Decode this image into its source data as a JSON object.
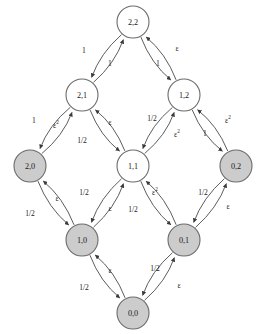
{
  "diagram": {
    "type": "directed-graph",
    "colors": {
      "node_fill_absorbing": "#cccccc",
      "node_fill_open": "#ffffff",
      "node_stroke": "#6b6b6b",
      "edge_stroke": "#4a4a4a",
      "background": "#ffffff",
      "text": "#1a1a1a"
    },
    "nodes": [
      {
        "id": "2,2",
        "label": "2,2",
        "x": 133,
        "y": 22,
        "r": 16,
        "filled": false
      },
      {
        "id": "2,1",
        "label": "2,1",
        "x": 82,
        "y": 95,
        "r": 16,
        "filled": false
      },
      {
        "id": "1,2",
        "label": "1,2",
        "x": 184,
        "y": 95,
        "r": 16,
        "filled": false
      },
      {
        "id": "2,0",
        "label": "2,0",
        "x": 30,
        "y": 166,
        "r": 16,
        "filled": true
      },
      {
        "id": "1,1",
        "label": "1,1",
        "x": 133,
        "y": 166,
        "r": 16,
        "filled": false
      },
      {
        "id": "0,2",
        "label": "0,2",
        "x": 236,
        "y": 166,
        "r": 16,
        "filled": true
      },
      {
        "id": "1,0",
        "label": "1,0",
        "x": 82,
        "y": 240,
        "r": 16,
        "filled": true
      },
      {
        "id": "0,1",
        "label": "0,1",
        "x": 184,
        "y": 240,
        "r": 16,
        "filled": true
      },
      {
        "id": "0,0",
        "label": "0,0",
        "x": 133,
        "y": 313,
        "r": 16,
        "filled": true
      }
    ],
    "edges": [
      {
        "from": "2,1",
        "to": "2,2",
        "label": "1",
        "sup": "",
        "lx": 84,
        "ly": 50
      },
      {
        "from": "2,2",
        "to": "2,1",
        "label": "1",
        "sup": "",
        "lx": 110,
        "ly": 63
      },
      {
        "from": "1,2",
        "to": "2,2",
        "label": "ε",
        "sup": "",
        "lx": 177,
        "ly": 48
      },
      {
        "from": "2,2",
        "to": "1,2",
        "label": "1",
        "sup": "",
        "lx": 158,
        "ly": 63
      },
      {
        "from": "2,0",
        "to": "2,1",
        "label": "1",
        "sup": "",
        "lx": 34,
        "ly": 120
      },
      {
        "from": "2,1",
        "to": "2,0",
        "label": "ε",
        "sup": "2",
        "lx": 56,
        "ly": 125
      },
      {
        "from": "2,1",
        "to": "1,1",
        "label": "ε",
        "sup": "",
        "lx": 110,
        "ly": 122
      },
      {
        "from": "1,1",
        "to": "2,1",
        "label": "1/2",
        "sup": "",
        "lx": 82,
        "ly": 140
      },
      {
        "from": "1,1",
        "to": "1,2",
        "label": "1/2",
        "sup": "",
        "lx": 152,
        "ly": 118
      },
      {
        "from": "1,2",
        "to": "1,1",
        "label": "ε",
        "sup": "2",
        "lx": 177,
        "ly": 134
      },
      {
        "from": "1,2",
        "to": "0,2",
        "label": "ε",
        "sup": "2",
        "lx": 228,
        "ly": 120
      },
      {
        "from": "0,2",
        "to": "1,2",
        "label": "1",
        "sup": "",
        "lx": 205,
        "ly": 133
      },
      {
        "from": "2,0",
        "to": "1,0",
        "label": "ε",
        "sup": "",
        "lx": 57,
        "ly": 198
      },
      {
        "from": "1,0",
        "to": "2,0",
        "label": "1/2",
        "sup": "",
        "lx": 30,
        "ly": 213
      },
      {
        "from": "1,1",
        "to": "1,0",
        "label": "1/2",
        "sup": "",
        "lx": 84,
        "ly": 192
      },
      {
        "from": "1,0",
        "to": "1,1",
        "label": "ε",
        "sup": "",
        "lx": 110,
        "ly": 208
      },
      {
        "from": "1,1",
        "to": "0,1",
        "label": "ε",
        "sup": "2",
        "lx": 155,
        "ly": 192
      },
      {
        "from": "0,1",
        "to": "1,1",
        "label": "1/2",
        "sup": "",
        "lx": 133,
        "ly": 209
      },
      {
        "from": "0,1",
        "to": "0,2",
        "label": "1/2",
        "sup": "",
        "lx": 203,
        "ly": 192
      },
      {
        "from": "0,2",
        "to": "0,1",
        "label": "ε",
        "sup": "",
        "lx": 228,
        "ly": 206
      },
      {
        "from": "1,0",
        "to": "0,0",
        "label": "ε",
        "sup": "",
        "lx": 110,
        "ly": 270
      },
      {
        "from": "0,0",
        "to": "1,0",
        "label": "1/2",
        "sup": "",
        "lx": 84,
        "ly": 287
      },
      {
        "from": "0,0",
        "to": "0,1",
        "label": "1/2",
        "sup": "",
        "lx": 155,
        "ly": 268
      },
      {
        "from": "0,1",
        "to": "0,0",
        "label": "ε",
        "sup": "",
        "lx": 179,
        "ly": 285
      }
    ]
  }
}
